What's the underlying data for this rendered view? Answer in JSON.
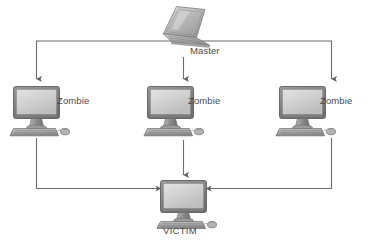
{
  "diagram": {
    "background_color": "#ffffff",
    "line_color": "#6b6b6b",
    "label_color": "#4a4a4a",
    "nodes": [
      {
        "id": "master",
        "label": "Master",
        "icon": "laptop-icon",
        "type": "laptop",
        "x": 183,
        "y": 28
      },
      {
        "id": "zombie-left",
        "label": "Zombie",
        "icon": "desktop-computer-icon",
        "type": "desktop",
        "x": 36,
        "y": 105
      },
      {
        "id": "zombie-mid",
        "label": "Zombie",
        "icon": "desktop-computer-icon",
        "type": "desktop",
        "x": 170,
        "y": 105
      },
      {
        "id": "zombie-right",
        "label": "Zombie",
        "icon": "desktop-computer-icon",
        "type": "desktop",
        "x": 302,
        "y": 105
      },
      {
        "id": "victim",
        "label": "VICTIM",
        "icon": "desktop-computer-icon",
        "type": "desktop",
        "x": 183,
        "y": 196
      }
    ],
    "edges": [
      {
        "id": "master-to-zombie-left",
        "from": "master",
        "to": "zombie-left",
        "arrow": "down"
      },
      {
        "id": "master-to-zombie-mid",
        "from": "master",
        "to": "zombie-mid",
        "arrow": "down"
      },
      {
        "id": "master-to-zombie-right",
        "from": "master",
        "to": "zombie-right",
        "arrow": "down"
      },
      {
        "id": "zombie-left-to-victim",
        "from": "zombie-left",
        "to": "victim",
        "arrow": "right"
      },
      {
        "id": "zombie-mid-to-victim",
        "from": "zombie-mid",
        "to": "victim",
        "arrow": "down"
      },
      {
        "id": "zombie-right-to-victim",
        "from": "zombie-right",
        "to": "victim",
        "arrow": "left"
      }
    ]
  }
}
